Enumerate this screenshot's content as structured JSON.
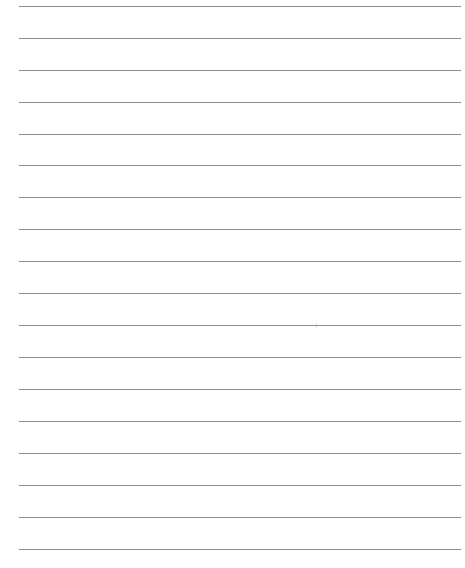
{
  "page": {
    "type": "lined-paper",
    "background": "#ffffff",
    "line_color": "#8e8e8e",
    "line_left": 19,
    "line_width": 442,
    "lines_y": [
      6,
      38,
      70,
      102,
      134,
      165,
      197,
      229,
      261,
      293,
      325,
      357,
      389,
      421,
      453,
      485,
      517,
      549
    ]
  }
}
